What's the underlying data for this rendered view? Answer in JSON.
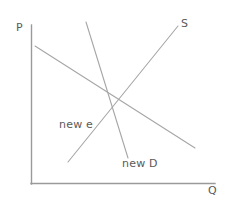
{
  "figure": {
    "width": 227,
    "height": 205,
    "background_color": "#ffffff"
  },
  "axes": {
    "vertical": {
      "label": "P",
      "name": "price-axis",
      "color": "#9a9a9a",
      "x": 31,
      "y_top": 25,
      "y_bottom": 184
    },
    "horizontal": {
      "label": "Q",
      "name": "quantity-axis",
      "color": "#9a9a9a",
      "x_left": 31,
      "x_right": 215,
      "y": 184
    }
  },
  "curves": [
    {
      "name": "demand-original",
      "label": "",
      "color": "#a6a6a6",
      "x1": 35,
      "y1": 46,
      "x2": 195,
      "y2": 148
    },
    {
      "name": "supply",
      "label": "S",
      "color": "#a6a6a6",
      "x1": 68,
      "y1": 162,
      "x2": 178,
      "y2": 26
    },
    {
      "name": "demand-new",
      "label": "new D",
      "color": "#a6a6a6",
      "x1": 86,
      "y1": 22,
      "x2": 128,
      "y2": 158
    }
  ],
  "labels": {
    "price_axis": "P",
    "quantity_axis": "Q",
    "supply": "S",
    "new_demand": "new D",
    "new_equilibrium": "new e"
  },
  "chart_data": {
    "type": "line",
    "title": "",
    "xlabel": "Q",
    "ylabel": "P",
    "grid": false,
    "legend": "inline-annotations",
    "xlim": [
      0,
      100
    ],
    "ylim": [
      0,
      100
    ],
    "series": [
      {
        "name": "Demand (original)",
        "annotation": "",
        "points": [
          [
            2,
            87
          ],
          [
            89,
            23
          ]
        ]
      },
      {
        "name": "Supply",
        "annotation": "S",
        "points": [
          [
            20,
            14
          ],
          [
            80,
            99
          ]
        ]
      },
      {
        "name": "new D",
        "annotation": "new D",
        "points": [
          [
            30,
            102
          ],
          [
            53,
            16
          ]
        ]
      }
    ],
    "annotations": [
      {
        "text": "new e",
        "x": 40,
        "y": 39,
        "note": "new equilibrium where new D crosses S"
      },
      {
        "text": "S",
        "x": 82,
        "y": 101
      },
      {
        "text": "new D",
        "x": 50,
        "y": 13
      }
    ]
  }
}
